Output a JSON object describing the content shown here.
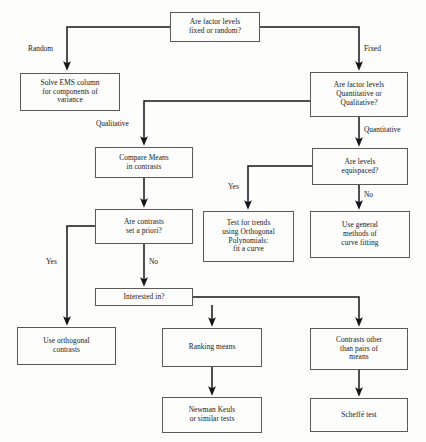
{
  "diagram": {
    "background_color": "#fdfdfb",
    "line_color": "#16161a",
    "box_border_color": "#5a5a57"
  },
  "nodes": {
    "factor_levels_fixed_random": "Are factor levels\nfixed or random?",
    "solve_ems_column": "Solve EMS column\nfor components of\nvariance",
    "factor_levels_quant_qual": "Are factor levels\nQuantitative or\nQualitative?",
    "compare_means_contrasts": "Compare Means\nin contrasts",
    "are_levels_equispaced": "Are levels\nequispaced?",
    "contrasts_set_a_priori": "Are contrasts\nset a priori?",
    "test_for_trends": "Test for trends\nusing Orthogonal\nPolynomials:\nfit a curve",
    "use_general_methods": "Use general\nmethods of\ncurve fitting",
    "interested_in": "Interested in?",
    "use_orthogonal_contrasts": "Use orthogonal\ncontrasts",
    "ranking_means": "Ranking means",
    "contrasts_other_than_pairs": "Contrasts other\nthan pairs of\nmeans",
    "newman_keuls": "Newman Keuls\nor similar tests",
    "scheffe_test": "Scheffé  test"
  },
  "edge_labels": {
    "random": "Random",
    "fixed": "Fixed",
    "qualitative": "Qualitative",
    "quantitative": "Quantitative",
    "yes_equispaced": "Yes",
    "no_equispaced": "No",
    "yes_a_priori": "Yes",
    "no_a_priori": "No"
  }
}
